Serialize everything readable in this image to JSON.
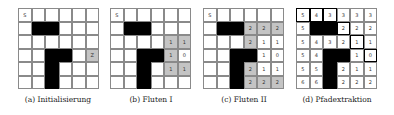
{
  "figure": {
    "panels": [
      {
        "id": "a",
        "caption": "(a) Initialisierung",
        "rows": [
          [
            "S",
            "",
            "",
            "",
            "",
            ""
          ],
          [
            "",
            "#",
            "#",
            "",
            "",
            ""
          ],
          [
            "",
            "",
            "",
            "",
            "",
            ""
          ],
          [
            "",
            "",
            "#",
            "#",
            "",
            "Z"
          ],
          [
            "",
            "",
            "#",
            "",
            "",
            ""
          ],
          [
            "",
            "",
            "#",
            "",
            "",
            ""
          ]
        ],
        "gray": [
          [
            3,
            5
          ]
        ],
        "path": []
      },
      {
        "id": "b",
        "caption": "(b) Fluten I",
        "rows": [
          [
            "S",
            "",
            "",
            "",
            "",
            ""
          ],
          [
            "",
            "#",
            "#",
            "",
            "",
            ""
          ],
          [
            "",
            "",
            "",
            "",
            "1",
            "1"
          ],
          [
            "",
            "",
            "#",
            "#",
            "1",
            "0"
          ],
          [
            "",
            "",
            "#",
            "",
            "1",
            "1"
          ],
          [
            "",
            "",
            "#",
            "",
            "",
            ""
          ]
        ],
        "gray": [
          [
            2,
            4
          ],
          [
            2,
            5
          ],
          [
            3,
            4
          ],
          [
            4,
            4
          ],
          [
            4,
            5
          ]
        ],
        "path": []
      },
      {
        "id": "c",
        "caption": "(c) Fluten II",
        "rows": [
          [
            "S",
            "",
            "",
            "",
            "",
            ""
          ],
          [
            "",
            "#",
            "#",
            "2",
            "2",
            "2"
          ],
          [
            "",
            "",
            "",
            "2",
            "1",
            "1"
          ],
          [
            "",
            "",
            "#",
            "#",
            "1",
            "0"
          ],
          [
            "",
            "",
            "#",
            "2",
            "1",
            "1"
          ],
          [
            "",
            "",
            "#",
            "2",
            "2",
            "2"
          ]
        ],
        "gray": [
          [
            1,
            3
          ],
          [
            1,
            4
          ],
          [
            1,
            5
          ],
          [
            2,
            3
          ],
          [
            4,
            3
          ],
          [
            5,
            3
          ],
          [
            5,
            4
          ],
          [
            5,
            5
          ]
        ],
        "path": []
      },
      {
        "id": "d",
        "caption": "(d) Pfadextraktion",
        "rows": [
          [
            "5",
            "4",
            "3",
            "3",
            "3",
            "3"
          ],
          [
            "5",
            "#",
            "#",
            "2",
            "2",
            "2"
          ],
          [
            "5",
            "4",
            "3",
            "2",
            "1",
            "1"
          ],
          [
            "5",
            "4",
            "#",
            "#",
            "1",
            "0"
          ],
          [
            "5",
            "5",
            "#",
            "2",
            "1",
            "1"
          ],
          [
            "6",
            "6",
            "#",
            "2",
            "2",
            "2"
          ]
        ],
        "gray": [],
        "path": [
          [
            0,
            0
          ],
          [
            0,
            1
          ],
          [
            0,
            2
          ],
          [
            1,
            3
          ],
          [
            2,
            4
          ],
          [
            3,
            5
          ]
        ]
      }
    ]
  }
}
